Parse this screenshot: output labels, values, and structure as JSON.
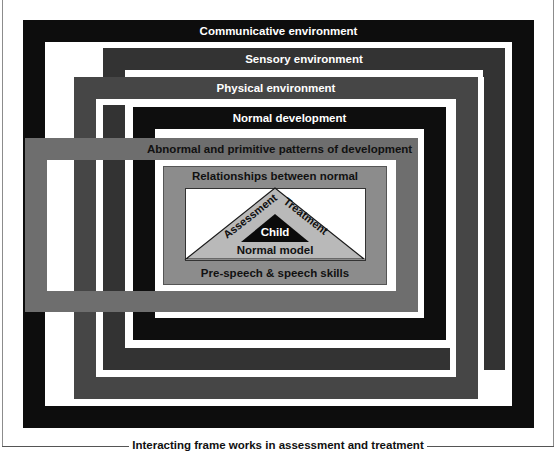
{
  "title": "Interacting frame works in assessment and treatment",
  "frames": [
    {
      "id": "communicative",
      "label": "Communicative environment",
      "color": "#0d0d0d"
    },
    {
      "id": "sensory",
      "label": "Sensory environment",
      "color": "#333333"
    },
    {
      "id": "physical",
      "label": "Physical environment",
      "color": "#464646"
    },
    {
      "id": "normal-development",
      "label": "Normal development",
      "color": "#0e0e0e"
    },
    {
      "id": "abnormal",
      "label": "Abnormal and primitive patterns of development",
      "color": "#6e6e6e"
    },
    {
      "id": "relationships",
      "label": "Relationships between normal",
      "color": "#8c8c8c"
    }
  ],
  "triangle": {
    "left_side": "Assessment",
    "right_side": "Treatment",
    "center": "Child",
    "base": "Normal model",
    "fill": "#b9b9b9",
    "inner_fill": "#0a0a0a"
  },
  "bottom_label": "Pre-speech & speech skills",
  "caption": "Interacting frame works in assessment and treatment"
}
